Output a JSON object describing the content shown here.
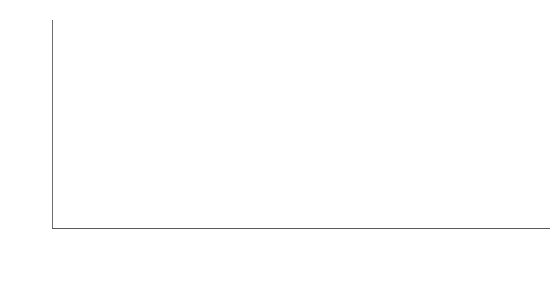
{
  "chart_data": {
    "type": "bar",
    "xlabel": "",
    "ylabel": "auto fuel use (Mbbl/d)",
    "ylim": [
      0,
      15
    ],
    "yticks": [
      "0",
      "5",
      "10",
      "15"
    ],
    "ytick_values": [
      0,
      5,
      10,
      15
    ],
    "grid": false,
    "legend": "none",
    "categories": [
      "2010\ndemand",
      "frozen\nefficiency\n2050\ndemand",
      "2050 EIA\nforecast\nsavings",
      "business-as-\nusual 2050\ndemand",
      "vehicle\nfitness",
      "electrification*",
      "Reinventing\nFire 2050\ndemand"
    ],
    "values": [
      8.8,
      15.0,
      3.9,
      11.1,
      3.6,
      7.0,
      0.4
    ],
    "value_labels": [
      "8.8",
      "15.0",
      "3.9",
      "11.1",
      "3.6",
      "7.0",
      "0.4"
    ],
    "bars": [
      {
        "label": "2010 demand",
        "label_lines": [
          "2010",
          "demand"
        ],
        "value": 8.8,
        "value_label": "8.8",
        "base": 0.0,
        "top": 8.8,
        "kind": "total",
        "color": "#3d3d3f"
      },
      {
        "label": "frozen efficiency 2050 demand",
        "label_lines": [
          "frozen",
          "efficiency",
          "2050",
          "demand"
        ],
        "value": 15.0,
        "value_label": "15.0",
        "base": 0.0,
        "top": 15.0,
        "kind": "total",
        "color": "#3d3d3f"
      },
      {
        "label": "2050 EIA forecast savings",
        "label_lines": [
          "2050 EIA",
          "forecast",
          "savings"
        ],
        "value": 3.9,
        "value_label": "3.9",
        "base": 11.1,
        "top": 15.0,
        "kind": "savings",
        "color": "#a7a9ac"
      },
      {
        "label": "business-as-usual 2050 demand",
        "label_lines": [
          "business-as-",
          "usual 2050",
          "demand"
        ],
        "value": 11.1,
        "value_label": "11.1",
        "base": 0.0,
        "top": 11.1,
        "kind": "total",
        "color": "#3d3d3f"
      },
      {
        "label": "vehicle fitness",
        "label_lines": [
          "vehicle",
          "fitness"
        ],
        "value": 3.6,
        "value_label": "3.6",
        "base": 7.5,
        "top": 11.1,
        "kind": "savings",
        "color": "#6d6e71"
      },
      {
        "label": "electrification*",
        "label_lines": [
          "electrification*"
        ],
        "value": 7.0,
        "value_label": "7.0",
        "base": 0.4,
        "top": 7.5,
        "kind": "savings",
        "color": "#636466"
      },
      {
        "label": "Reinventing Fire 2050 demand",
        "label_lines": [
          "Reinventing",
          "Fire 2050",
          "demand"
        ],
        "value": 0.4,
        "value_label": "0.4",
        "base": 0.0,
        "top": 0.4,
        "kind": "total",
        "color": "#3d3d3f"
      }
    ],
    "annotations": [
      {
        "name": "total-savings-bracket",
        "text_lines": [
          "95%",
          "total",
          "savings"
        ],
        "text": "95% total savings",
        "from_value": 11.1,
        "to_value": 0.4,
        "style": "dashed-bracket-with-arrow"
      }
    ],
    "footnote": "electrification*"
  },
  "colors": {
    "total_bar": "#3d3d3f",
    "savings_light": "#a7a9ac",
    "savings_mid": "#6d6e71",
    "savings_dark": "#636466",
    "axis": "#6d6e71",
    "text": "#231f20"
  }
}
